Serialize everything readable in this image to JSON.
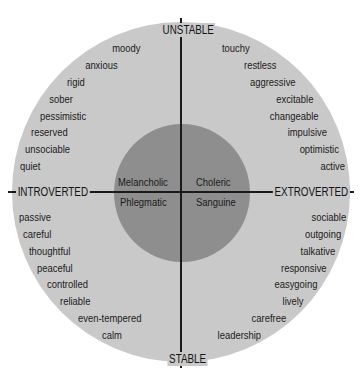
{
  "axes": {
    "top": "UNSTABLE",
    "bottom": "STABLE",
    "left": "INTROVERTED",
    "right": "EXTROVERTED"
  },
  "temperaments": {
    "top_left": "Melancholic",
    "top_right": "Choleric",
    "bottom_left": "Phlegmatic",
    "bottom_right": "Sanguine"
  },
  "traits": {
    "top_left": [
      "moody",
      "anxious",
      "rigid",
      "sober",
      "pessimistic",
      "reserved",
      "unsociable",
      "quiet"
    ],
    "top_right": [
      "touchy",
      "restless",
      "aggressive",
      "excitable",
      "changeable",
      "impulsive",
      "optimistic",
      "active"
    ],
    "bottom_left": [
      "passive",
      "careful",
      "thoughtful",
      "peaceful",
      "controlled",
      "reliable",
      "even-tempered",
      "calm"
    ],
    "bottom_right": [
      "sociable",
      "outgoing",
      "talkative",
      "responsive",
      "easygoing",
      "lively",
      "carefree",
      "leadership"
    ]
  },
  "colors": {
    "outer_circle": "#c9c9c9",
    "inner_circle": "#8e8e8e",
    "lines": "#1a1a1a",
    "text": "#1b1b1b"
  }
}
